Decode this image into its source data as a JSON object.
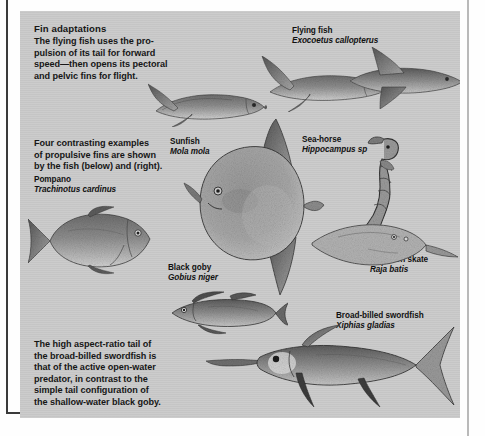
{
  "page": {
    "plate_background": "#c9c9c9",
    "page_background": "#fefefe",
    "rule_color": "#3a3a3a"
  },
  "intro": {
    "heading": "Fin adaptations",
    "lines": [
      "The flying fish uses the pro-",
      "pulsion of its tail for forward",
      "speed—then opens its pectoral",
      "and pelvic fins for flight."
    ]
  },
  "middle_note": {
    "lines": [
      "Four contrasting examples",
      "of propulsive fins are shown",
      "by the fish (below) and (right)."
    ]
  },
  "closing_note": {
    "lines": [
      "The high aspect-ratio tail of",
      "the broad-billed swordfish is",
      "that of the active open-water",
      "predator, in contrast to the",
      "simple tail configuration of",
      "the shallow-water black goby."
    ]
  },
  "labels": {
    "flying_fish": {
      "common": "Flying fish",
      "scientific": "Exocoetus callopterus"
    },
    "pompano": {
      "common": "Pompano",
      "scientific": "Trachinotus cardinus"
    },
    "sunfish": {
      "common": "Sunfish",
      "scientific": "Mola mola"
    },
    "seahorse": {
      "common": "Sea-horse",
      "scientific": "Hippocampus sp"
    },
    "skate": {
      "common": "Common skate",
      "scientific": "Raja batis"
    },
    "goby": {
      "common": "Black goby",
      "scientific": "Gobius niger"
    },
    "swordfish": {
      "common": "Broad-billed swordfish",
      "scientific": "Xiphias gladias"
    }
  },
  "figures": {
    "flying_fish_1": "flying-fish-illustration",
    "flying_fish_2": "flying-fish-illustration",
    "flying_fish_3": "flying-fish-illustration",
    "pompano": "pompano-illustration",
    "sunfish": "sunfish-illustration",
    "seahorse": "seahorse-illustration",
    "skate": "skate-illustration",
    "goby": "black-goby-illustration",
    "swordfish": "swordfish-illustration"
  }
}
